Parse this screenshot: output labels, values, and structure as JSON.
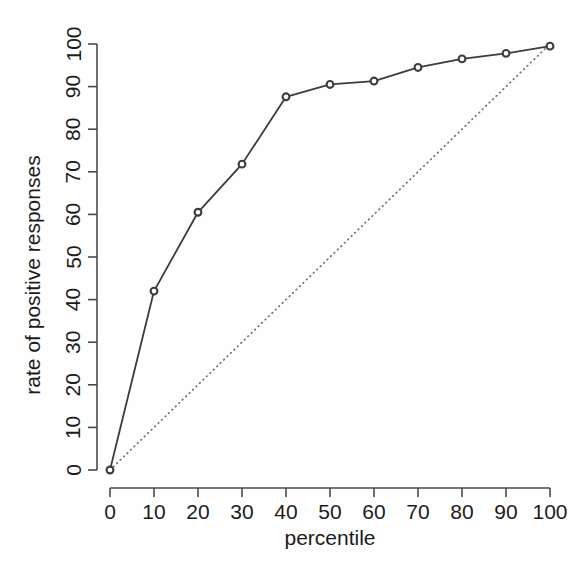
{
  "chart_data": {
    "type": "line",
    "title": "",
    "subtitle": "",
    "xlabel": "percentile",
    "ylabel": "rate of positive responses",
    "xlim": [
      0,
      100
    ],
    "ylim": [
      0,
      100
    ],
    "grid": false,
    "legend": "none",
    "x": [
      0,
      10,
      20,
      30,
      40,
      50,
      60,
      70,
      80,
      90,
      100
    ],
    "xticks": [
      "0",
      "10",
      "20",
      "30",
      "40",
      "50",
      "60",
      "70",
      "80",
      "90",
      "100"
    ],
    "yticks": [
      "0",
      "10",
      "20",
      "30",
      "40",
      "50",
      "60",
      "70",
      "80",
      "90",
      "100"
    ],
    "series": [
      {
        "name": "rate of positive responses",
        "style": "solid-with-circles",
        "color": "#3c3c3c",
        "values": [
          0,
          42,
          60.5,
          71.8,
          87.6,
          90.5,
          91.3,
          94.5,
          96.5,
          97.8,
          99.5
        ]
      },
      {
        "name": "reference diagonal",
        "style": "dotted",
        "color": "#6f6f6f",
        "values": [
          0,
          10,
          20,
          30,
          40,
          50,
          60,
          70,
          80,
          90,
          100
        ]
      }
    ],
    "annotations": []
  },
  "axes": {
    "x_title": "percentile",
    "y_title": "rate of positive responses"
  }
}
